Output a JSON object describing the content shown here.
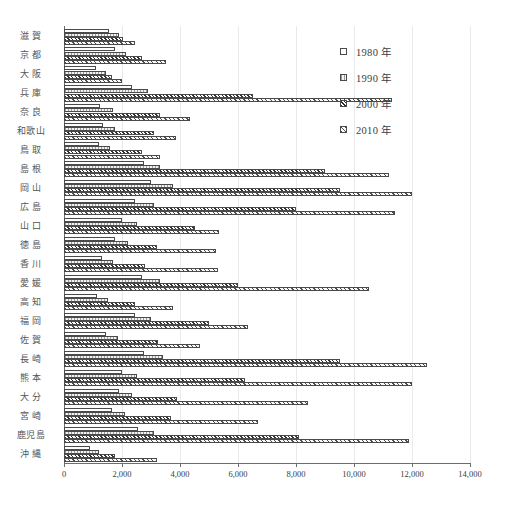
{
  "legend": {
    "position": "top-right",
    "items": [
      {
        "label": "1980 年",
        "swatch": "pattern-open-1980"
      },
      {
        "label": "1990 年",
        "swatch": "pattern-light-1990"
      },
      {
        "label": "2000 年",
        "swatch": "pattern-hatch-2000"
      },
      {
        "label": "2010 年",
        "swatch": "pattern-hatch-2010"
      }
    ]
  },
  "axis": {
    "tick_labels": [
      "0",
      "2,000",
      "4,000",
      "6,000",
      "8,000",
      "10,000",
      "12,000",
      "14,000"
    ],
    "tick_values": [
      0,
      2000,
      4000,
      6000,
      8000,
      10000,
      12000,
      14000
    ],
    "min": 0,
    "max": 14000
  },
  "caption": "",
  "chart_data": {
    "type": "bar",
    "orientation": "horizontal",
    "title": "",
    "xlabel": "",
    "ylabel": "",
    "xlim": [
      0,
      14000
    ],
    "grid": true,
    "legend_position": "top-right",
    "categories": [
      "滋 賀",
      "京 都",
      "大 阪",
      "兵 庫",
      "奈 良",
      "和歌山",
      "鳥 取",
      "島 根",
      "岡 山",
      "広 島",
      "山 口",
      "徳 島",
      "香 川",
      "愛 媛",
      "高 知",
      "福 岡",
      "佐 賀",
      "長 崎",
      "熊 本",
      "大 分",
      "宮 崎",
      "鹿児島",
      "沖 縄"
    ],
    "series": [
      {
        "name": "1980 年",
        "values": [
          1550,
          1750,
          1100,
          2350,
          1250,
          1350,
          1200,
          2750,
          3000,
          2450,
          2000,
          1750,
          1300,
          2700,
          1150,
          2450,
          1450,
          2750,
          2000,
          1900,
          1650,
          2550,
          900
        ]
      },
      {
        "name": "1990 年",
        "values": [
          1900,
          2150,
          1450,
          2900,
          1700,
          1750,
          1600,
          3300,
          3750,
          3100,
          2500,
          2200,
          1700,
          3300,
          1500,
          3000,
          1850,
          3400,
          2500,
          2350,
          2100,
          3100,
          1200
        ]
      },
      {
        "name": "2000 年",
        "values": [
          2050,
          2700,
          1650,
          6500,
          3300,
          3100,
          2700,
          9000,
          9500,
          8000,
          4500,
          3200,
          2800,
          6000,
          2450,
          5000,
          3250,
          9500,
          6250,
          3900,
          3700,
          8100,
          1750
        ]
      },
      {
        "name": "2010 年",
        "values": [
          2450,
          3500,
          2000,
          11300,
          4350,
          3850,
          3300,
          11200,
          12000,
          11400,
          5350,
          5250,
          5300,
          10500,
          3750,
          6350,
          4700,
          12500,
          12000,
          8400,
          6700,
          11900,
          3200
        ]
      }
    ]
  }
}
